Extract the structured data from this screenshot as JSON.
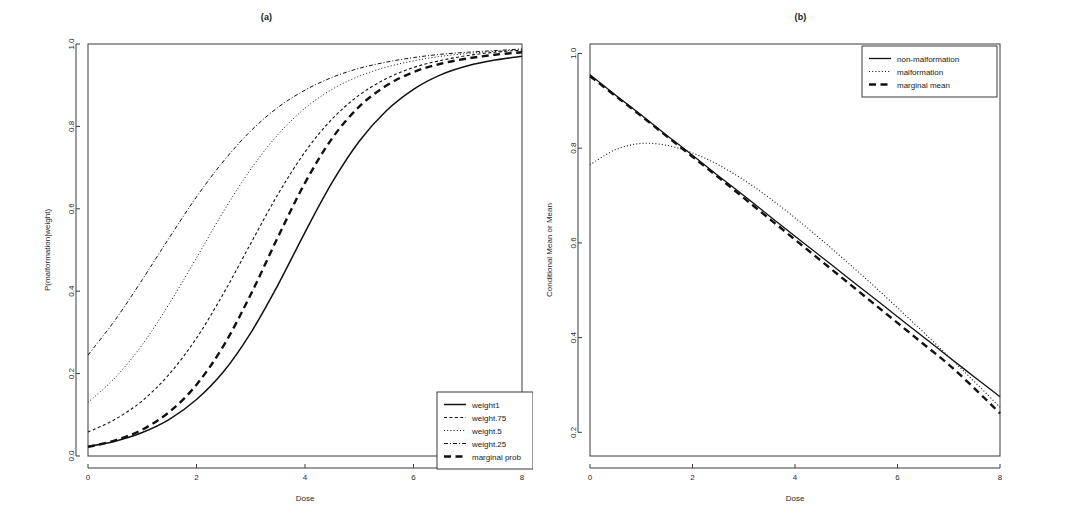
{
  "figure": {
    "background": "#ffffff",
    "ink": "#111111",
    "axis_color": "#3b3b3b"
  },
  "chart_data": [
    {
      "type": "line",
      "panel": "a",
      "title": "(a)",
      "xlabel": "Dose",
      "ylabel": "P(malformation|weight)",
      "xlim": [
        0,
        8
      ],
      "ylim": [
        0,
        1
      ],
      "xticks": [
        0,
        2,
        4,
        6,
        8
      ],
      "xticklabels": [
        "0",
        "2",
        "4",
        "6",
        "8"
      ],
      "yticks": [
        0.0,
        0.2,
        0.4,
        0.6,
        0.8,
        1.0
      ],
      "yticklabels": [
        "0.0",
        "0.2",
        "0.4",
        "0.6",
        "0.8",
        "1.0"
      ],
      "grid": false,
      "legend_position": "bottom-right",
      "x": [
        0,
        0.5,
        1,
        1.5,
        2,
        2.5,
        3,
        3.5,
        4,
        4.5,
        5,
        5.5,
        6,
        6.5,
        7,
        7.5,
        8
      ],
      "series": [
        {
          "name": "weight1",
          "style": "solid",
          "width": 1.5,
          "values": [
            0.023,
            0.036,
            0.057,
            0.089,
            0.137,
            0.205,
            0.299,
            0.415,
            0.543,
            0.664,
            0.764,
            0.838,
            0.89,
            0.925,
            0.947,
            0.961,
            0.97
          ]
        },
        {
          "name": "weight.75",
          "style": "dashed",
          "width": 1.1,
          "values": [
            0.058,
            0.089,
            0.134,
            0.199,
            0.286,
            0.395,
            0.516,
            0.635,
            0.738,
            0.818,
            0.876,
            0.916,
            0.943,
            0.96,
            0.972,
            0.98,
            0.985
          ]
        },
        {
          "name": "weight.5",
          "style": "dotted",
          "width": 1.0,
          "values": [
            0.13,
            0.19,
            0.27,
            0.37,
            0.481,
            0.594,
            0.696,
            0.78,
            0.844,
            0.89,
            0.922,
            0.944,
            0.959,
            0.97,
            0.977,
            0.982,
            0.986
          ]
        },
        {
          "name": "weight.25",
          "style": "dashdot",
          "width": 1.0,
          "values": [
            0.245,
            0.33,
            0.428,
            0.53,
            0.629,
            0.716,
            0.789,
            0.846,
            0.888,
            0.919,
            0.941,
            0.956,
            0.967,
            0.975,
            0.98,
            0.984,
            0.988
          ]
        },
        {
          "name": "marginal prob",
          "style": "longdash",
          "width": 2.4,
          "values": [
            0.022,
            0.038,
            0.064,
            0.107,
            0.173,
            0.268,
            0.392,
            0.531,
            0.663,
            0.771,
            0.848,
            0.899,
            0.932,
            0.952,
            0.965,
            0.974,
            0.98
          ]
        }
      ],
      "legend": [
        {
          "label": "weight1",
          "style": "solid",
          "width": 1.5
        },
        {
          "label": "weight.75",
          "style": "dashed",
          "width": 1.1
        },
        {
          "label": "weight.5",
          "style": "dotted",
          "width": 1.0
        },
        {
          "label": "weight.25",
          "style": "dashdot",
          "width": 1.0
        },
        {
          "label": "marginal prob",
          "style": "longdash",
          "width": 2.4
        }
      ]
    },
    {
      "type": "line",
      "panel": "b",
      "title": "(b)",
      "xlabel": "Dose",
      "ylabel": "Conditional Mean or Mean",
      "xlim": [
        0,
        8
      ],
      "ylim": [
        0.15,
        1.02
      ],
      "xticks": [
        0,
        2,
        4,
        6,
        8
      ],
      "xticklabels": [
        "0",
        "2",
        "4",
        "6",
        "8"
      ],
      "yticks": [
        0.2,
        0.4,
        0.6,
        0.8,
        1.0
      ],
      "yticklabels": [
        "0.2",
        "0.4",
        "0.6",
        "0.8",
        "1.0"
      ],
      "grid": false,
      "legend_position": "top-right",
      "x": [
        0,
        0.5,
        1,
        1.5,
        2,
        2.5,
        3,
        3.5,
        4,
        4.5,
        5,
        5.5,
        6,
        6.5,
        7,
        7.5,
        8
      ],
      "series": [
        {
          "name": "non-malformation",
          "style": "solid",
          "width": 1.3,
          "values": [
            0.955,
            0.912,
            0.87,
            0.827,
            0.785,
            0.742,
            0.7,
            0.657,
            0.614,
            0.572,
            0.529,
            0.487,
            0.444,
            0.402,
            0.359,
            0.317,
            0.275
          ]
        },
        {
          "name": "malformation",
          "style": "dotted",
          "width": 1.1,
          "values": [
            0.765,
            0.797,
            0.81,
            0.806,
            0.79,
            0.765,
            0.733,
            0.695,
            0.653,
            0.608,
            0.561,
            0.513,
            0.463,
            0.412,
            0.36,
            0.307,
            0.253
          ]
        },
        {
          "name": "marginal mean",
          "style": "longdash",
          "width": 2.4,
          "values": [
            0.952,
            0.91,
            0.868,
            0.825,
            0.782,
            0.739,
            0.695,
            0.651,
            0.607,
            0.563,
            0.519,
            0.475,
            0.431,
            0.387,
            0.343,
            0.293,
            0.24
          ]
        }
      ],
      "legend": [
        {
          "label": "non-malformation",
          "style": "solid",
          "width": 1.3
        },
        {
          "label": "malformation",
          "style": "dotted",
          "width": 1.1
        },
        {
          "label": "marginal mean",
          "style": "longdash",
          "width": 2.4
        }
      ]
    }
  ]
}
